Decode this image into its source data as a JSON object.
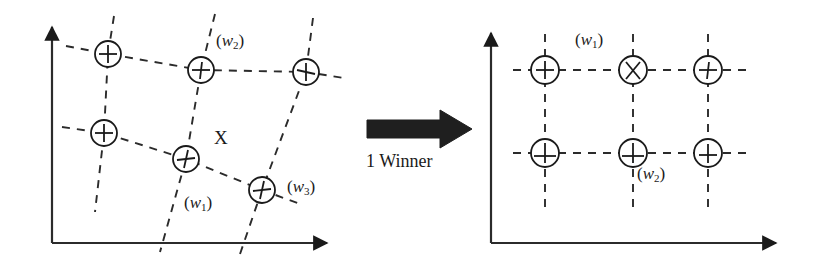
{
  "figure": {
    "type": "diagram",
    "background_color": "#ffffff",
    "ink_color": "#1a1a1a",
    "width": 816,
    "height": 269
  },
  "transition": {
    "arrow_icon": "right-arrow-icon",
    "label": "1 Winner"
  },
  "left_panel": {
    "name": "distorted-grid-panel",
    "axes": {
      "y_axis": {
        "icon": "up-arrow-axis-icon",
        "x": 52,
        "y_top": 22,
        "y_bottom": 243
      },
      "x_axis": {
        "icon": "right-arrow-axis-icon",
        "y": 243,
        "x_left": 52,
        "x_right": 333
      }
    },
    "nodes": [
      {
        "id": "L1",
        "marker": "circle-plus",
        "cx": 108,
        "cy": 54,
        "r": 13
      },
      {
        "id": "L2",
        "marker": "circle-plus",
        "cx": 201,
        "cy": 70,
        "r": 13
      },
      {
        "id": "L3",
        "marker": "circle-plus",
        "cx": 306,
        "cy": 72,
        "r": 13
      },
      {
        "id": "L4",
        "marker": "circle-plus",
        "cx": 104,
        "cy": 133,
        "r": 13
      },
      {
        "id": "L5",
        "marker": "circle-plus",
        "cx": 186,
        "cy": 159,
        "r": 13
      },
      {
        "id": "L6",
        "marker": "circle-plus",
        "cx": 262,
        "cy": 190,
        "r": 13
      }
    ],
    "row_connections": [
      {
        "from": "L1",
        "to": "L2"
      },
      {
        "from": "L2",
        "to": "L3"
      },
      {
        "from": "L4",
        "to": "L5"
      },
      {
        "from": "L5",
        "to": "L6"
      }
    ],
    "column_connections": [
      {
        "from": "L1",
        "to": "L4"
      },
      {
        "from": "L2",
        "to": "L5"
      },
      {
        "from": "L3",
        "to": "L6"
      }
    ],
    "labels": [
      {
        "name": "label-w2",
        "text_prefix": "(",
        "var": "w",
        "sub": "2",
        "text_suffix": ")",
        "x": 216,
        "y": 32
      },
      {
        "name": "label-w1",
        "text_prefix": "(",
        "var": "w",
        "sub": "1",
        "text_suffix": ")",
        "x": 184,
        "y": 194
      },
      {
        "name": "label-w3",
        "text_prefix": "(",
        "var": "w",
        "sub": "3",
        "text_suffix": ")",
        "x": 287,
        "y": 178
      },
      {
        "name": "label-input-x",
        "text": "X",
        "x": 214,
        "y": 128
      }
    ]
  },
  "right_panel": {
    "name": "regular-grid-panel",
    "axes": {
      "y_axis": {
        "icon": "up-arrow-axis-icon",
        "x": 491,
        "y_top": 28,
        "y_bottom": 243
      },
      "x_axis": {
        "icon": "right-arrow-axis-icon",
        "y": 243,
        "x_left": 491,
        "x_right": 782
      }
    },
    "nodes": [
      {
        "id": "R1",
        "marker": "circle-plus",
        "cx": 545,
        "cy": 70,
        "r": 14
      },
      {
        "id": "R2",
        "marker": "circle-x",
        "cx": 633,
        "cy": 70,
        "r": 14
      },
      {
        "id": "R3",
        "marker": "circle-plus",
        "cx": 708,
        "cy": 70,
        "r": 14
      },
      {
        "id": "R4",
        "marker": "circle-plus",
        "cx": 545,
        "cy": 153,
        "r": 14
      },
      {
        "id": "R5",
        "marker": "circle-plus",
        "cx": 633,
        "cy": 153,
        "r": 14
      },
      {
        "id": "R6",
        "marker": "circle-plus",
        "cx": 708,
        "cy": 153,
        "r": 14
      }
    ],
    "labels": [
      {
        "name": "label-w1",
        "text_prefix": "(",
        "var": "w",
        "sub": "1",
        "text_suffix": ")",
        "x": 575,
        "y": 31
      },
      {
        "name": "label-w2",
        "text_prefix": "(",
        "var": "w",
        "sub": "2",
        "text_suffix": ")",
        "x": 637,
        "y": 165
      }
    ]
  }
}
